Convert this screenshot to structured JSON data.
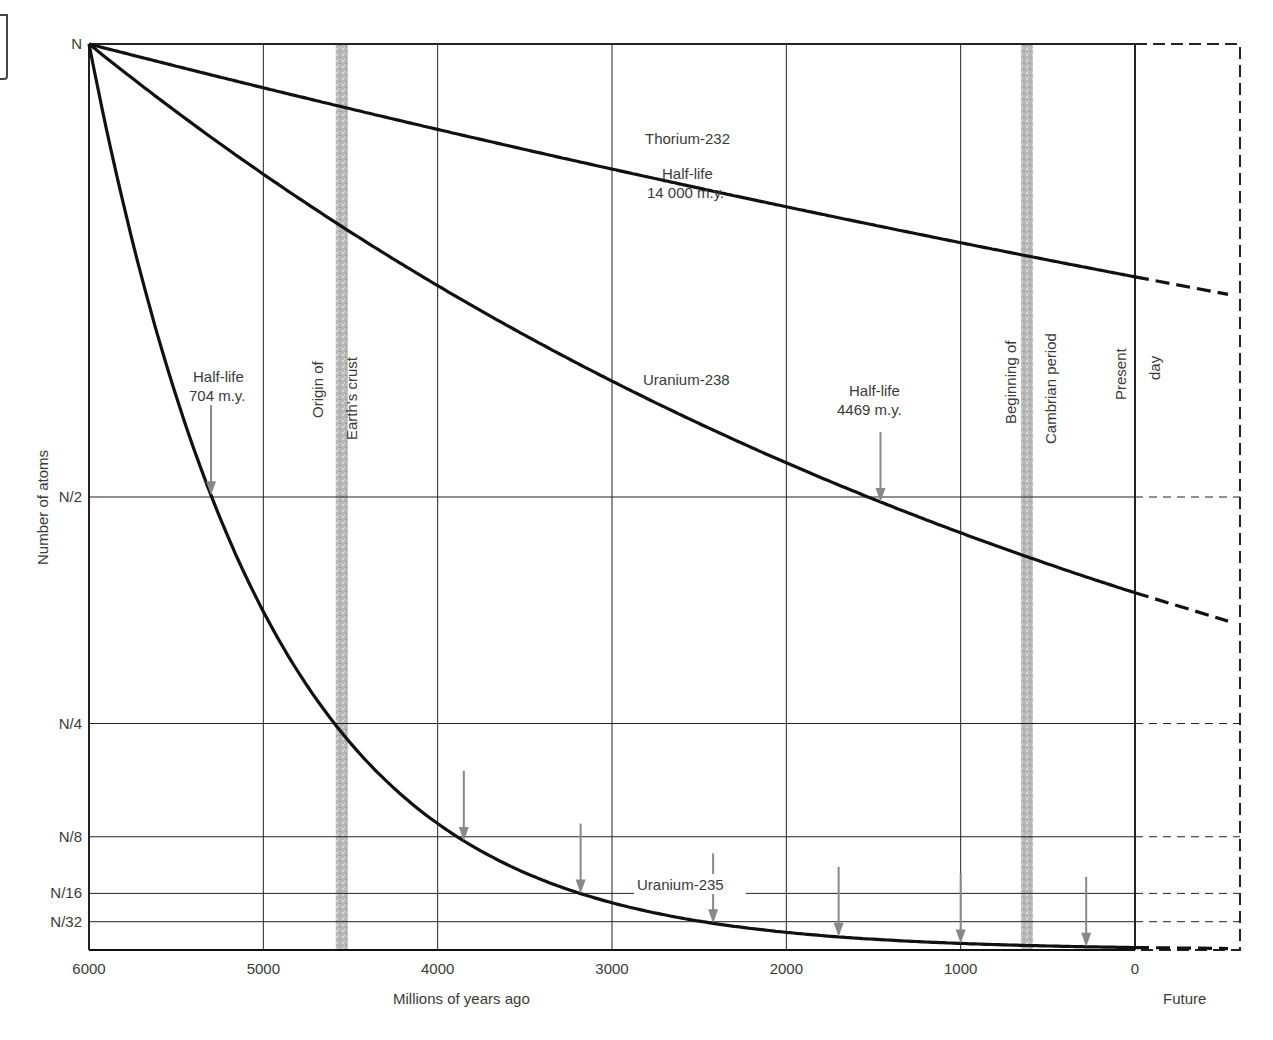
{
  "chart_data": {
    "type": "line",
    "title": "",
    "xlabel": "Millions of years ago",
    "ylabel": "Number of atoms",
    "x_range": [
      6000,
      0
    ],
    "x_ticks": [
      "6000",
      "5000",
      "4000",
      "3000",
      "2000",
      "1000",
      "0"
    ],
    "x_tick_values": [
      6000,
      5000,
      4000,
      3000,
      2000,
      1000,
      0
    ],
    "future_label": "Future",
    "y_ticks": [
      "N",
      "N/2",
      "N/4",
      "N/8",
      "N/16",
      "N/32"
    ],
    "y_tick_values": [
      1,
      0.5,
      0.25,
      0.125,
      0.0625,
      0.03125
    ],
    "grid": true,
    "series": [
      {
        "name": "Thorium-232",
        "half_life_my": 14000,
        "half_life_label": "Half-life",
        "half_life_value": "14 000 m.y.",
        "x": [
          6000,
          5000,
          4000,
          3000,
          2000,
          1000,
          0
        ],
        "values": [
          1.0,
          0.952,
          0.906,
          0.862,
          0.82,
          0.781,
          0.743
        ]
      },
      {
        "name": "Uranium-238",
        "half_life_my": 4469,
        "half_life_label": "Half-life",
        "half_life_value": "4469 m.y.",
        "x": [
          6000,
          5000,
          4000,
          3000,
          2000,
          1000,
          0
        ],
        "values": [
          1.0,
          0.856,
          0.733,
          0.628,
          0.537,
          0.46,
          0.394
        ]
      },
      {
        "name": "Uranium-235",
        "half_life_my": 704,
        "half_life_label": "Half-life",
        "half_life_value": "704 m.y.",
        "x": [
          6000,
          5000,
          4000,
          3000,
          2000,
          1000,
          0
        ],
        "values": [
          1.0,
          0.373,
          0.139,
          0.052,
          0.028,
          0.018,
          0.012
        ]
      }
    ],
    "annotations": [
      {
        "text": [
          "Origin of",
          "Earth's crust"
        ],
        "x": 4550,
        "type": "vertical-band"
      },
      {
        "text": [
          "Beginning of",
          "Cambrian period"
        ],
        "x": 620,
        "type": "vertical-band"
      },
      {
        "text": [
          "Present",
          "day"
        ],
        "x": 0,
        "type": "vertical-line"
      }
    ],
    "u235_halflife_arrows_x": [
      5300,
      3850,
      3180,
      2420,
      1700,
      1000,
      280
    ],
    "u238_halflife_arrow_x": 1460
  }
}
